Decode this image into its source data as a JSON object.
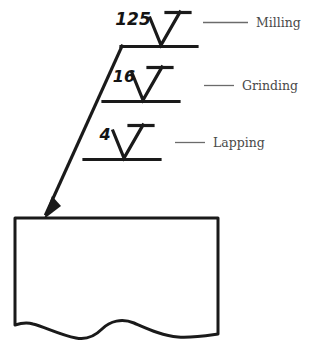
{
  "drawing": {
    "title": "Surface Finish Symbols on Part",
    "stroke_color": "#1a1a1a",
    "label_color": "#4a4a4a",
    "background": "#ffffff",
    "callouts": [
      {
        "roughness": "125",
        "process": "Milling",
        "symbol": "surface-finish-check",
        "leader_dash": "—————"
      },
      {
        "roughness": "16",
        "process": "Grinding",
        "symbol": "surface-finish-check",
        "leader_dash": "—————"
      },
      {
        "roughness": "4",
        "process": "Lapping",
        "symbol": "surface-finish-check",
        "leader_dash": "—————"
      }
    ],
    "part": {
      "name": "workpiece-section",
      "break_line": "wavy-break"
    },
    "arrow": {
      "name": "leader-arrowhead",
      "points_to": "top-surface-of-part"
    }
  }
}
